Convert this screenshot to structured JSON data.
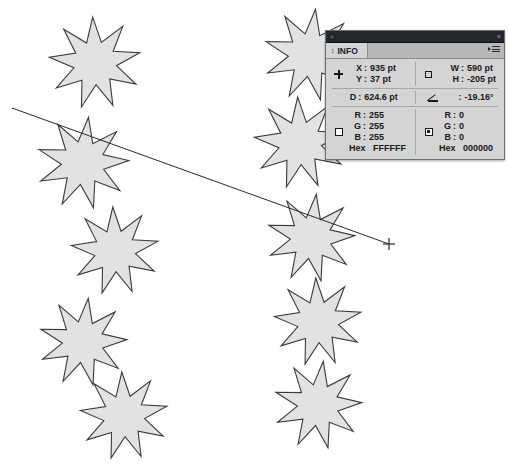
{
  "app": {
    "canvas_background": "#ffffff"
  },
  "artwork": {
    "shape_name": "nine-pointed-star",
    "fill_color": "#e2e2e2",
    "stroke_color": "#3a3a3a",
    "stars": [
      {
        "cx": 95,
        "cy": 63,
        "r": 46
      },
      {
        "cx": 83,
        "cy": 163,
        "r": 46
      },
      {
        "cx": 115,
        "cy": 251,
        "r": 44
      },
      {
        "cx": 83,
        "cy": 342,
        "r": 44
      },
      {
        "cx": 124,
        "cy": 416,
        "r": 44
      },
      {
        "cx": 310,
        "cy": 55,
        "r": 46
      },
      {
        "cx": 300,
        "cy": 143,
        "r": 46
      },
      {
        "cx": 311,
        "cy": 238,
        "r": 44
      },
      {
        "cx": 318,
        "cy": 322,
        "r": 44
      },
      {
        "cx": 318,
        "cy": 405,
        "r": 44
      }
    ],
    "measure_line": {
      "name": "measure-line",
      "x1": 12,
      "y1": 108,
      "x2": 389,
      "y2": 244,
      "stroke_color": "#2a2a2a"
    },
    "cursor": {
      "name": "crosshair-cursor",
      "x": 389,
      "y": 244
    }
  },
  "info_panel": {
    "tab_label": "INFO",
    "titlebar": {
      "collapse_glyph": "»"
    },
    "position": {
      "x_label": "X",
      "x_value": "935 pt",
      "y_label": "Y",
      "y_value": "37 pt",
      "icon": "crosshair-icon"
    },
    "dimensions": {
      "w_label": "W",
      "w_value": "590 pt",
      "h_label": "H",
      "h_value": "-205 pt",
      "icon": "rectangle-icon"
    },
    "distance": {
      "label": "D",
      "value": "624.6 pt"
    },
    "angle": {
      "label": "",
      "value": "-19.16°",
      "icon": "angle-icon"
    },
    "fill_color": {
      "icon": "fill-swatch-icon",
      "r_label": "R",
      "r_value": "255",
      "g_label": "G",
      "g_value": "255",
      "b_label": "B",
      "b_value": "255",
      "hex_label": "Hex",
      "hex_value": "FFFFFF"
    },
    "stroke_color": {
      "icon": "stroke-swatch-icon",
      "r_label": "R",
      "r_value": "0",
      "g_label": "G",
      "g_value": "0",
      "b_label": "B",
      "b_value": "0",
      "hex_label": "Hex",
      "hex_value": "000000"
    },
    "colon": ":"
  }
}
